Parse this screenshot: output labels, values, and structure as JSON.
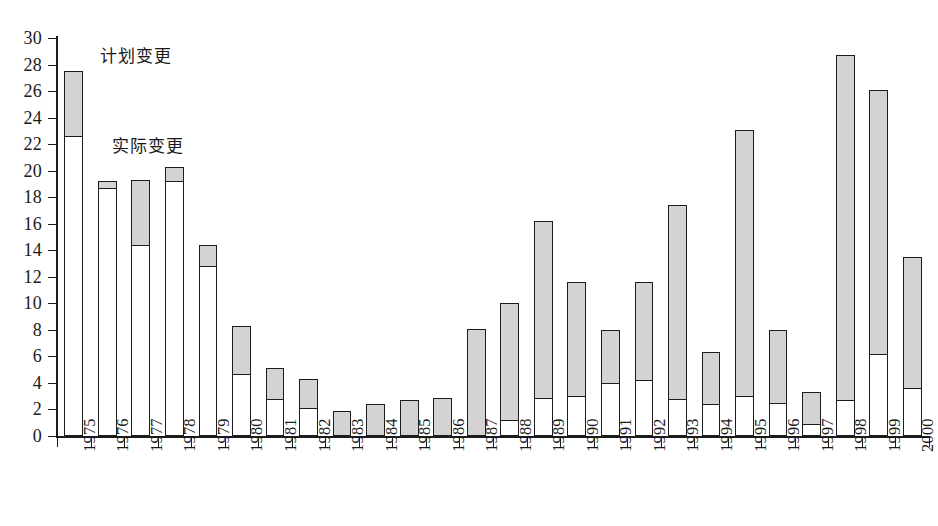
{
  "chart_data": {
    "type": "bar",
    "title": "",
    "subtitle": "",
    "xlabel": "",
    "ylabel": "",
    "ylim": [
      0,
      30
    ],
    "ytick_step": 2,
    "yticks": [
      0,
      2,
      4,
      6,
      8,
      10,
      12,
      14,
      16,
      18,
      20,
      22,
      24,
      26,
      28,
      30
    ],
    "grid": false,
    "stacked": true,
    "legend_position": "inside-top-left",
    "categories": [
      "1975",
      "1976",
      "1977",
      "1978",
      "1979",
      "1980",
      "1981",
      "1982",
      "1983",
      "1984",
      "1985",
      "1986",
      "1987",
      "1988",
      "1989",
      "1990",
      "1991",
      "1992",
      "1993",
      "1994",
      "1995",
      "1996",
      "1997",
      "1998",
      "1999",
      "2000"
    ],
    "series": [
      {
        "name": "实际变更",
        "color": "#ffffff",
        "values": [
          22.6,
          18.7,
          14.4,
          19.2,
          12.8,
          4.7,
          2.8,
          2.1,
          1.9,
          2.4,
          2.7,
          2.9,
          8.1,
          1.2,
          2.9,
          3.0,
          4.0,
          4.2,
          2.8,
          2.4,
          3.0,
          2.5,
          0.9,
          2.7,
          6.2,
          3.6
        ]
      },
      {
        "name": "计划变更",
        "color": "#d3d3d3",
        "values": [
          27.5,
          19.2,
          19.3,
          20.3,
          14.4,
          8.3,
          5.1,
          4.3,
          1.9,
          2.4,
          2.7,
          2.9,
          8.1,
          10.0,
          16.2,
          11.6,
          8.0,
          11.6,
          17.4,
          6.3,
          23.1,
          8.0,
          3.3,
          28.7,
          26.1,
          13.5
        ]
      }
    ],
    "legend": [
      {
        "label": "计划变更",
        "swatch": "#d3d3d3"
      },
      {
        "label": "实际变更",
        "swatch": "#ffffff"
      }
    ],
    "caption": ""
  }
}
